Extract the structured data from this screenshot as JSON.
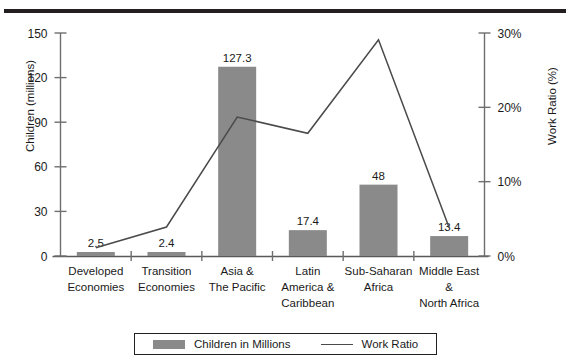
{
  "chart_data": {
    "type": "bar",
    "title": "",
    "subtitle": "",
    "xlabel": "",
    "ylabel": "Children (millions)",
    "y2label": "Work Ratio (%)",
    "categories": [
      "Developed Economies",
      "Transition Economies",
      "Asia & The Pacific",
      "Latin America & Caribbean",
      "Sub-Saharan Africa",
      "Middle East & North Africa"
    ],
    "category_lines": [
      [
        "Developed",
        "Economies"
      ],
      [
        "Transition",
        "Economies"
      ],
      [
        "Asia &",
        "The Pacific"
      ],
      [
        "Latin",
        "America &",
        "Caribbean"
      ],
      [
        "Sub-Saharan",
        "Africa"
      ],
      [
        "Middle East",
        "&",
        "North Africa"
      ]
    ],
    "series": [
      {
        "name": "Children in Millions",
        "type": "bar",
        "axis": "left",
        "values": [
          2.5,
          2.4,
          127.3,
          17.4,
          48,
          13.4
        ],
        "labels": [
          "2.5",
          "2.4",
          "127.3",
          "17.4",
          "48",
          "13.4"
        ],
        "color": "#8a8a8a"
      },
      {
        "name": "Work Ratio",
        "type": "line",
        "axis": "right",
        "values": [
          1.1,
          3.9,
          18.7,
          16.5,
          29.1,
          3.8
        ],
        "color": "#4a4a4a"
      }
    ],
    "ylim": [
      0,
      150
    ],
    "yticks": [
      0,
      30,
      60,
      90,
      120,
      150
    ],
    "ytick_labels": [
      "0",
      "30",
      "60",
      "90",
      "120",
      "150"
    ],
    "y2lim": [
      0,
      30
    ],
    "y2ticks": [
      0,
      10,
      20,
      30
    ],
    "y2tick_labels": [
      "0%",
      "10%",
      "20%",
      "30%"
    ],
    "grid": false,
    "legend_position": "bottom"
  },
  "legend": {
    "bar_label": "Children in Millions",
    "line_label": "Work Ratio"
  }
}
